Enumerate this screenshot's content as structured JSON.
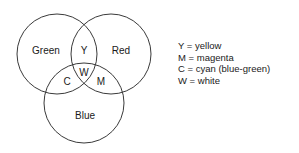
{
  "diagram": {
    "type": "venn",
    "circles": [
      {
        "id": "green",
        "label": "Green",
        "cx": 57,
        "cy": 54,
        "r": 40
      },
      {
        "id": "red",
        "label": "Red",
        "cx": 111,
        "cy": 54,
        "r": 40
      },
      {
        "id": "blue",
        "label": "Blue",
        "cx": 84,
        "cy": 103,
        "r": 40
      }
    ],
    "regions": {
      "yellow": "Y",
      "white": "W",
      "cyan": "C",
      "magenta": "M"
    },
    "stroke_color": "#3a3a3a"
  },
  "legend": {
    "items": [
      {
        "key": "Y",
        "text": "Y = yellow"
      },
      {
        "key": "M",
        "text": "M = magenta"
      },
      {
        "key": "C",
        "text": "C = cyan (blue-green)"
      },
      {
        "key": "W",
        "text": "W = white"
      }
    ]
  }
}
